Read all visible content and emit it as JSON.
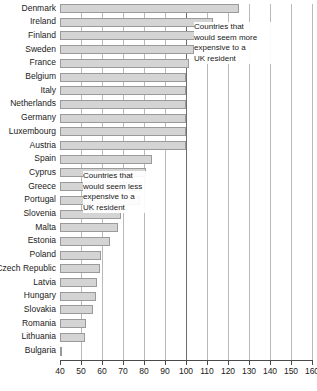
{
  "chart_data": {
    "type": "bar",
    "orientation": "horizontal",
    "title": "",
    "subtitle": "",
    "xlabel": "",
    "ylabel": "",
    "xlim": [
      40,
      160
    ],
    "xticks": [
      40,
      50,
      60,
      70,
      80,
      90,
      100,
      110,
      120,
      130,
      140,
      150,
      160
    ],
    "grid": true,
    "gridlines_x": [
      50,
      60,
      70,
      80,
      90,
      100,
      110,
      120,
      130,
      140,
      150,
      160
    ],
    "reference_line": 100,
    "legend": "none",
    "baseline_value": 40,
    "categories": [
      "Denmark",
      "Ireland",
      "Finland",
      "Sweden",
      "France",
      "Belgium",
      "Italy",
      "Netherlands",
      "Germany",
      "Luxembourg",
      "Austria",
      "Spain",
      "Cyprus",
      "Greece",
      "Portugal",
      "Slovenia",
      "Malta",
      "Estonia",
      "Poland",
      "Czech Republic",
      "Latvia",
      "Hungary",
      "Slovakia",
      "Romania",
      "Lithuania",
      "Bulgaria"
    ],
    "values": [
      125,
      113,
      112,
      104,
      101.5,
      100,
      100,
      100,
      100,
      100,
      100,
      84,
      81,
      79,
      78,
      69,
      67.5,
      64,
      59.5,
      59,
      57.5,
      57,
      55.5,
      52.5,
      52,
      40
    ],
    "bar_fill_color": "#d4d4d4",
    "bar_border_color": "#9a9a9a",
    "annotations": [
      {
        "name": "more-expensive-note",
        "text": "Countries that\nwould seem more\nexpensive to a\nUK resident"
      },
      {
        "name": "less-expensive-note",
        "text": "Countries that\nwould seem less\nexpensive to a\nUK resident"
      }
    ]
  }
}
